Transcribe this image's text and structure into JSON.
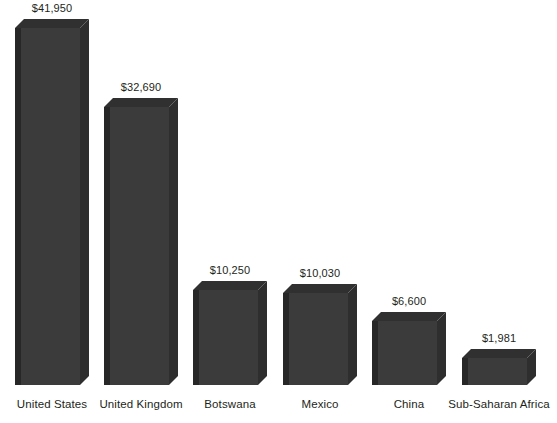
{
  "chart_data": {
    "type": "bar",
    "title": "",
    "subtitle": "",
    "xlabel": "",
    "ylabel": "",
    "grid": false,
    "legend": null,
    "axis_visible": false,
    "value_prefix": "$",
    "style": "3d-extruded-bars",
    "categories": [
      "United States",
      "United Kingdom",
      "Botswana",
      "Mexico",
      "China",
      "Sub-Saharan Africa"
    ],
    "values": [
      41950,
      32690,
      10250,
      10030,
      6600,
      1981
    ],
    "value_labels": [
      "$41,950",
      "$32,690",
      "$10,250",
      "$10,030",
      "$6,600",
      "$1,981"
    ],
    "ylim": [
      0,
      41950
    ],
    "colors": {
      "bar_front": "#3b3b3b",
      "bar_side": "#2e2e2e",
      "bar_top": "#303030",
      "bar_left_edge": "#272727",
      "background": "#ffffff",
      "text": "#231f20"
    }
  },
  "bars": [
    {
      "category": "United States",
      "value": 41950,
      "value_label": "$41,950",
      "x": 15,
      "width": 65,
      "height": 357,
      "depth": 9
    },
    {
      "category": "United Kingdom",
      "value": 32690,
      "value_label": "$32,690",
      "x": 104,
      "width": 65,
      "height": 278,
      "depth": 9
    },
    {
      "category": "Botswana",
      "value": 10250,
      "value_label": "$10,250",
      "x": 193,
      "width": 65,
      "height": 95,
      "depth": 9
    },
    {
      "category": "Mexico",
      "value": 10030,
      "value_label": "$10,030",
      "x": 283,
      "width": 65,
      "height": 92,
      "depth": 9
    },
    {
      "category": "China",
      "value": 6600,
      "value_label": "$6,600",
      "x": 372,
      "width": 65,
      "height": 64,
      "depth": 9
    },
    {
      "category": "Sub-Saharan Africa",
      "value": 1981,
      "value_label": "$1,981",
      "x": 462,
      "width": 65,
      "height": 27,
      "depth": 9
    }
  ]
}
